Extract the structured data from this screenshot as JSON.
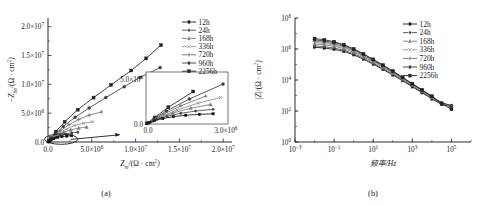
{
  "figure": {
    "panels": [
      {
        "id": "a",
        "caption": "(a)"
      },
      {
        "id": "b",
        "caption": "(b)"
      }
    ]
  },
  "panel_a": {
    "caption": "(a)",
    "xlabel_parts": {
      "sym": "Z",
      "sub": "re",
      "rest": "/(Ω · cm",
      "sup": "2",
      "close": ")"
    },
    "ylabel_parts": {
      "sym": "−Z",
      "sub": "im",
      "rest": "/(Ω · cm",
      "sup": "2",
      "close": ")"
    },
    "xticks": [
      "0.0",
      "5.0×10⁶",
      "1.0×10⁷",
      "1.5×10⁷",
      "2.0×10⁷"
    ],
    "yticks": [
      "0.0",
      "5.0×10⁶",
      "1.0×10⁷",
      "1.5×10⁷",
      "2.0×10⁷"
    ],
    "inset": {
      "xticks": [
        "0.0",
        "3.0×10⁶"
      ],
      "yticks": [
        "0.0",
        "5.0×10⁶"
      ]
    },
    "legend": [
      "12h",
      "24h",
      "168h",
      "336h",
      "720h",
      "960h",
      "2256h"
    ]
  },
  "panel_b": {
    "caption": "(b)",
    "xlabel": "频率/Hz",
    "ylabel_parts": {
      "sym": "|Z|",
      "rest": "/(Ω · cm",
      "sup": "2",
      "close": ")"
    },
    "xticks": [
      "10⁻³",
      "10⁻¹",
      "10¹",
      "10³",
      "10⁵"
    ],
    "yticks": [
      "10⁰",
      "10²",
      "10⁴",
      "10⁶",
      "10⁸"
    ],
    "legend": [
      "12h",
      "24h",
      "168h",
      "336h",
      "720h",
      "960h",
      "2256h"
    ]
  },
  "chart_data": [
    {
      "type": "scatter",
      "panel": "a",
      "title": "",
      "xlabel": "Z_re/(Ω·cm²)",
      "ylabel": "-Z_im/(Ω·cm²)",
      "xlim": [
        0,
        21000000
      ],
      "ylim": [
        0,
        21500000
      ],
      "xticks": [
        0,
        5000000,
        10000000,
        15000000,
        20000000
      ],
      "yticks": [
        0,
        5000000,
        10000000,
        15000000,
        20000000
      ],
      "grid": false,
      "legend_position": "top-right",
      "annotations": [
        {
          "kind": "ellipse",
          "cx": 1500000,
          "cy": 500000,
          "rx": 1900000,
          "ry": 900000
        },
        {
          "kind": "arrow",
          "x1": 2600000,
          "y1": 450000,
          "x2": 8200000,
          "y2": 1250000
        }
      ],
      "series": [
        {
          "name": "2256h",
          "marker": "square",
          "x": [
            80000,
            350000,
            900000,
            1900000,
            3400000,
            5200000,
            7200000,
            9500000,
            11200000,
            12900000
          ],
          "y": [
            120000,
            700000,
            1800000,
            3500000,
            5600000,
            7700000,
            9900000,
            12400000,
            14500000,
            16800000
          ]
        },
        {
          "name": "960h",
          "marker": "circle",
          "x": [
            70000,
            320000,
            820000,
            1750000,
            3100000,
            4700000,
            6600000,
            8700000,
            10500000,
            12800000
          ],
          "y": [
            100000,
            560000,
            1400000,
            2700000,
            4300000,
            5900000,
            7700000,
            9600000,
            11200000,
            12900000
          ]
        },
        {
          "name": "720h",
          "marker": "plus",
          "x": [
            60000,
            280000,
            700000,
            1400000,
            2400000,
            3500000,
            4700000,
            6100000
          ],
          "y": [
            90000,
            430000,
            1050000,
            1950000,
            3000000,
            3900000,
            4650000,
            5200000
          ]
        },
        {
          "name": "336h",
          "marker": "cross",
          "x": [
            55000,
            250000,
            620000,
            1250000,
            2100000,
            3000000,
            4050000,
            5100000
          ],
          "y": [
            80000,
            360000,
            830000,
            1500000,
            2250000,
            2850000,
            3250000,
            3500000
          ]
        },
        {
          "name": "168h",
          "marker": "triangle",
          "x": [
            50000,
            220000,
            540000,
            1080000,
            1800000,
            2600000,
            3500000,
            4400000
          ],
          "y": [
            70000,
            300000,
            680000,
            1180000,
            1700000,
            2100000,
            2400000,
            2600000
          ]
        },
        {
          "name": "24h",
          "marker": "dot",
          "x": [
            40000,
            180000,
            430000,
            850000,
            1400000,
            2000000,
            2700000,
            3400000
          ],
          "y": [
            55000,
            230000,
            500000,
            830000,
            1150000,
            1400000,
            1580000,
            1700000
          ]
        },
        {
          "name": "12h",
          "marker": "square-small",
          "x": [
            30000,
            140000,
            340000,
            680000,
            1100000,
            1600000,
            2150000,
            2700000
          ],
          "y": [
            40000,
            170000,
            360000,
            590000,
            790000,
            940000,
            1040000,
            1100000
          ]
        }
      ],
      "inset": {
        "xlim": [
          0,
          3300000
        ],
        "ylim": [
          0,
          5600000
        ],
        "xticks": [
          0,
          3000000
        ],
        "yticks": [
          0,
          5000000
        ],
        "note": "magnified view of the near-origin cluster circled in the main axes"
      }
    },
    {
      "type": "line",
      "panel": "b",
      "title": "",
      "xlabel": "频率/Hz",
      "ylabel": "|Z|/(Ω·cm²)",
      "xscale": "log",
      "yscale": "log",
      "xlim": [
        0.001,
        1000000
      ],
      "ylim": [
        1,
        100000000
      ],
      "xticks": [
        0.001,
        0.1,
        10,
        1000,
        100000
      ],
      "yticks": [
        1,
        100,
        10000,
        1000000,
        100000000
      ],
      "grid": false,
      "legend_position": "top-right",
      "x": [
        0.01,
        0.0316,
        0.1,
        0.316,
        1,
        3.16,
        10,
        31.6,
        100,
        316,
        1000,
        3160,
        10000,
        31600,
        100000
      ],
      "series": [
        {
          "name": "12h",
          "values": [
            1300000,
            1150000,
            950000,
            700000,
            420000,
            220000,
            105000,
            48000,
            21000,
            9000,
            3600,
            1500,
            600,
            260,
            190
          ]
        },
        {
          "name": "24h",
          "values": [
            1600000,
            1400000,
            1150000,
            830000,
            500000,
            260000,
            120000,
            55000,
            24000,
            10000,
            4100,
            1700,
            680,
            280,
            200
          ]
        },
        {
          "name": "168h",
          "values": [
            2100000,
            1850000,
            1500000,
            1050000,
            620000,
            310000,
            145000,
            65000,
            28000,
            11500,
            4600,
            1900,
            750,
            300,
            210
          ]
        },
        {
          "name": "336h",
          "values": [
            2600000,
            2250000,
            1800000,
            1250000,
            720000,
            360000,
            165000,
            72000,
            31000,
            12500,
            5000,
            2050,
            800,
            320,
            215
          ]
        },
        {
          "name": "720h",
          "values": [
            3200000,
            2750000,
            2150000,
            1450000,
            820000,
            400000,
            180000,
            79000,
            33500,
            13500,
            5300,
            2150,
            840,
            330,
            220
          ]
        },
        {
          "name": "960h",
          "values": [
            3900000,
            3300000,
            2550000,
            1680000,
            930000,
            450000,
            200000,
            86000,
            36000,
            14300,
            5600,
            2250,
            870,
            340,
            225
          ]
        },
        {
          "name": "2256h",
          "values": [
            4700000,
            3950000,
            2950000,
            1900000,
            1030000,
            490000,
            215000,
            92000,
            38000,
            15000,
            5800,
            2320,
            890,
            300,
            130
          ]
        }
      ]
    }
  ]
}
